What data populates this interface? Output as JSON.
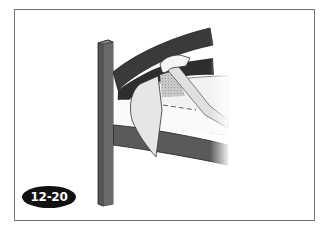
{
  "figure": {
    "label": "12-20",
    "colors": {
      "frame_border": "#777777",
      "dark_rail": "#3a3a3a",
      "lower_rail": "#5a5a5a",
      "post": "#555555",
      "sheet": "#e6e6e6",
      "mattress": "#f4f4f4",
      "badge_bg": "#111111",
      "badge_text": "#ffffff"
    }
  }
}
